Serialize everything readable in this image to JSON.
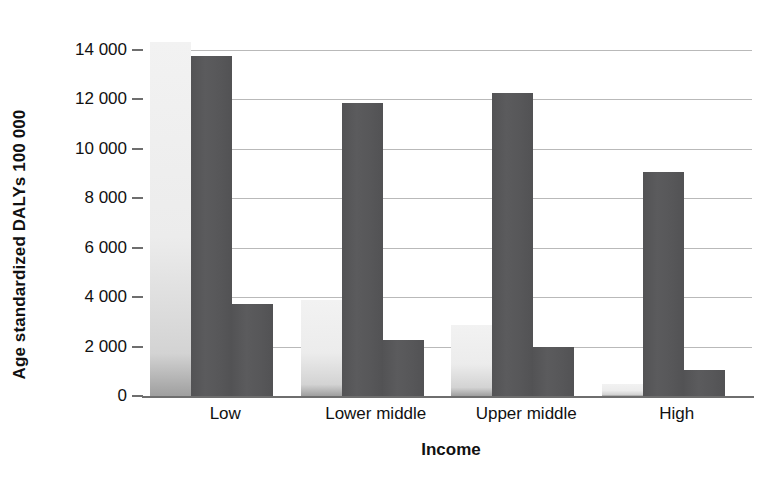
{
  "chart_data": {
    "type": "bar",
    "title": "",
    "xlabel": "Income",
    "ylabel": "Age standardized DALYs 100 000",
    "categories": [
      "Low",
      "Lower middle",
      "Upper middle",
      "High"
    ],
    "ylim": [
      0,
      14800
    ],
    "yticks": [
      0,
      2000,
      4000,
      6000,
      8000,
      10000,
      12000,
      14000
    ],
    "ytick_labels": [
      "0",
      "2 000",
      "4 000",
      "6 000",
      "8 000",
      "10 000",
      "12 000",
      "14 000"
    ],
    "grid": true,
    "legend": "none",
    "series": [
      {
        "name": "series-1",
        "color": "#ececec",
        "values": [
          14300,
          3900,
          2880,
          480
        ]
      },
      {
        "name": "series-2",
        "color": "#58585a",
        "values": [
          13750,
          11830,
          12250,
          9040
        ]
      },
      {
        "name": "series-3",
        "color": "#58585a",
        "values": [
          3740,
          2250,
          1980,
          1060
        ]
      }
    ]
  },
  "colors": {
    "light_bar": "#ececec",
    "dark_bar": "#58585a",
    "gridline": "#b9b9b9",
    "axis": "#6e6e6e",
    "text": "#111111",
    "background": "#ffffff"
  }
}
